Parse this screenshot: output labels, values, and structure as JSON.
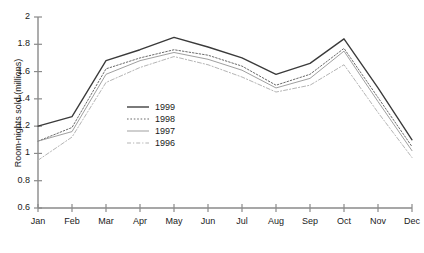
{
  "chart_data": {
    "type": "line",
    "title": "",
    "xlabel": "",
    "ylabel": "Room-nights sold (millions)",
    "categories": [
      "Jan",
      "Feb",
      "Mar",
      "Apr",
      "May",
      "Jun",
      "Jul",
      "Aug",
      "Sep",
      "Oct",
      "Nov",
      "Dec"
    ],
    "ylim": [
      0.6,
      2.0
    ],
    "yticks": [
      0.6,
      0.8,
      1.0,
      1.2,
      1.4,
      1.6,
      1.8,
      2.0
    ],
    "ytick_labels": [
      "0.6",
      "0.8",
      "1",
      "1.2",
      "1.4",
      "1.6",
      "1.8",
      "2"
    ],
    "grid": false,
    "legend_position": "center-left",
    "series": [
      {
        "name": "1999",
        "style": "solid",
        "color": "#3a3a3a",
        "values": [
          1.2,
          1.27,
          1.68,
          1.76,
          1.85,
          1.78,
          1.7,
          1.58,
          1.66,
          1.84,
          1.48,
          1.1
        ]
      },
      {
        "name": "1998",
        "style": "dotted",
        "color": "#6b6b6b",
        "values": [
          1.09,
          1.19,
          1.62,
          1.7,
          1.76,
          1.72,
          1.64,
          1.5,
          1.58,
          1.77,
          1.41,
          1.05
        ]
      },
      {
        "name": "1997",
        "style": "solid-thin",
        "color": "#9a9a9a",
        "values": [
          1.09,
          1.16,
          1.58,
          1.68,
          1.74,
          1.69,
          1.61,
          1.48,
          1.55,
          1.75,
          1.38,
          1.02
        ]
      },
      {
        "name": "1996",
        "style": "dash-dot",
        "color": "#b5b5b5",
        "values": [
          0.95,
          1.12,
          1.52,
          1.63,
          1.71,
          1.65,
          1.56,
          1.45,
          1.5,
          1.65,
          1.3,
          0.97
        ]
      }
    ]
  }
}
